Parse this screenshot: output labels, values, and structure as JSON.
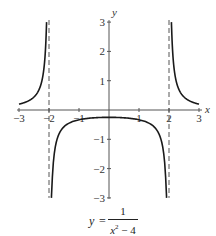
{
  "chart_data": {
    "type": "line",
    "title": "",
    "function": "y = 1/(x^2 - 4)",
    "xlabel": "x",
    "ylabel": "y",
    "xlim": [
      -3,
      3
    ],
    "ylim": [
      -3,
      3
    ],
    "x_ticks": [
      -3,
      -2,
      -1,
      1,
      2,
      3
    ],
    "x_tick_labels": [
      "−3",
      "−2",
      "−1",
      "1",
      "2",
      "3"
    ],
    "y_ticks": [
      -3,
      -2,
      -1,
      1,
      2,
      3
    ],
    "y_tick_labels": [
      "−3",
      "−2",
      "−1",
      "1",
      "2",
      "3"
    ],
    "vertical_asymptotes": [
      -2,
      2
    ],
    "asymptote_style": "dashed",
    "grid": false,
    "legend": null,
    "series": [
      {
        "name": "left branch",
        "x": [
          -3,
          -2.8,
          -2.6,
          -2.4,
          -2.3,
          -2.2,
          -2.15,
          -2.1,
          -2.08
        ],
        "y": [
          0.2,
          0.26,
          0.36,
          0.57,
          0.78,
          1.19,
          1.61,
          2.44,
          3.0
        ]
      },
      {
        "name": "middle branch",
        "x": [
          -1.92,
          -1.9,
          -1.8,
          -1.5,
          -1.0,
          -0.5,
          0,
          0.5,
          1.0,
          1.5,
          1.8,
          1.9,
          1.92
        ],
        "y": [
          -3.0,
          -2.56,
          -1.32,
          -0.57,
          -0.33,
          -0.27,
          -0.25,
          -0.27,
          -0.33,
          -0.57,
          -1.32,
          -2.56,
          -3.0
        ]
      },
      {
        "name": "right branch",
        "x": [
          2.08,
          2.1,
          2.15,
          2.2,
          2.3,
          2.4,
          2.6,
          2.8,
          3
        ],
        "y": [
          3.0,
          2.44,
          1.61,
          1.19,
          0.78,
          0.57,
          0.36,
          0.26,
          0.2
        ]
      }
    ],
    "caption": {
      "lhs": "y",
      "equals": "=",
      "numerator": "1",
      "denominator_base": "x",
      "denominator_exp": "2",
      "denominator_rest": " − 4"
    }
  },
  "colors": {
    "curve": "#1a1a1a",
    "axis": "#555555",
    "asymptote": "#555555",
    "background": "#ffffff"
  }
}
